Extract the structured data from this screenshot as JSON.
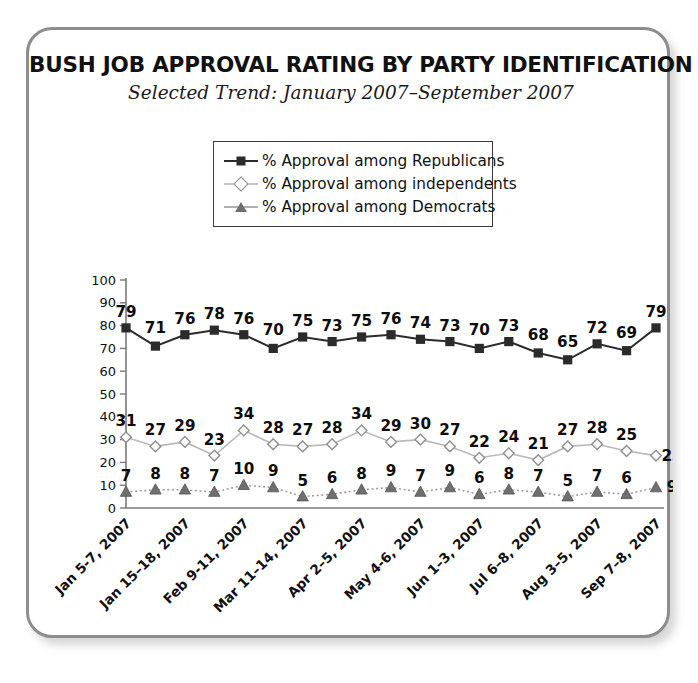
{
  "header": {
    "title": "BUSH JOB APPROVAL RATING BY PARTY IDENTIFICATION",
    "subtitle": "Selected Trend: January 2007–September 2007"
  },
  "legend": {
    "position": "top-center",
    "items": [
      {
        "label": "% Approval among Republicans",
        "marker": "square-icon",
        "color": "#2b2b2b"
      },
      {
        "label": "% Approval among independents",
        "marker": "diamond-icon",
        "color": "#8a8a8a"
      },
      {
        "label": "% Approval among Democrats",
        "marker": "triangle-icon",
        "color": "#6f6f6f"
      }
    ]
  },
  "chart_data": {
    "type": "line",
    "title": "BUSH JOB APPROVAL RATING BY PARTY IDENTIFICATION",
    "subtitle": "Selected Trend: January 2007–September 2007",
    "xlabel": "",
    "ylabel": "",
    "ylim": [
      0,
      100
    ],
    "yticks": [
      0,
      10,
      20,
      30,
      40,
      50,
      60,
      70,
      80,
      90,
      100
    ],
    "ytick_labels": [
      "0",
      "10",
      "20",
      "30",
      "40",
      "50",
      "60",
      "70",
      "80",
      "90",
      "100"
    ],
    "grid": false,
    "legend_position": "top-center",
    "x": [
      1,
      2,
      3,
      4,
      5,
      6,
      7,
      8,
      9,
      10,
      11,
      12,
      13,
      14,
      15,
      16,
      17,
      18,
      19
    ],
    "xtick_labels": [
      "Jan 5-7, 2007",
      "Jan 15–18, 2007",
      "Feb 9-11, 2007",
      "Mar 11–14, 2007",
      "Apr 2–5, 2007",
      "May 4-6, 2007",
      "Jun 1–3, 2007",
      "Jul 6–8, 2007",
      "Aug 3–5, 2007",
      "Sep 7–8, 2007"
    ],
    "xtick_indices": [
      0,
      2,
      4,
      6,
      8,
      10,
      12,
      14,
      16,
      18
    ],
    "series": [
      {
        "name": "% Approval among Republicans",
        "color": "#2b2b2b",
        "marker": "square",
        "line_style": "solid",
        "values": [
          79,
          71,
          76,
          78,
          76,
          70,
          75,
          73,
          75,
          76,
          74,
          73,
          70,
          73,
          68,
          65,
          72,
          69,
          79
        ],
        "label_offsets": [
          -1,
          1,
          -1,
          -1,
          -1,
          1,
          -1,
          -1,
          -1,
          -1,
          -1,
          -1,
          1,
          -1,
          1,
          1,
          -1,
          1,
          -1
        ]
      },
      {
        "name": "% Approval among independents",
        "color": "#9a9a9a",
        "marker": "diamond",
        "line_style": "solid",
        "values": [
          31,
          27,
          29,
          23,
          34,
          28,
          27,
          28,
          34,
          29,
          30,
          27,
          22,
          24,
          21,
          27,
          28,
          25,
          23
        ],
        "label_offsets": [
          -1,
          -1,
          -1,
          -1,
          -1,
          -1,
          -1,
          -1,
          -1,
          -1,
          -1,
          -1,
          -1,
          -1,
          -1,
          -1,
          -1,
          -1,
          0
        ]
      },
      {
        "name": "% Approval among Democrats",
        "color": "#6f6f6f",
        "marker": "triangle",
        "line_style": "dotted",
        "values": [
          7,
          8,
          8,
          7,
          10,
          9,
          5,
          6,
          8,
          9,
          7,
          9,
          6,
          8,
          7,
          5,
          7,
          6,
          9
        ],
        "label_offsets": [
          -1,
          -1,
          -1,
          -1,
          -1,
          -1,
          -1,
          -1,
          -1,
          -1,
          -1,
          -1,
          -1,
          -1,
          -1,
          -1,
          -1,
          -1,
          0
        ]
      }
    ]
  },
  "colors": {
    "frame_border": "#8d8d8d",
    "axis": "#7a7a7a",
    "background": "#ffffff",
    "text": "#111111"
  }
}
